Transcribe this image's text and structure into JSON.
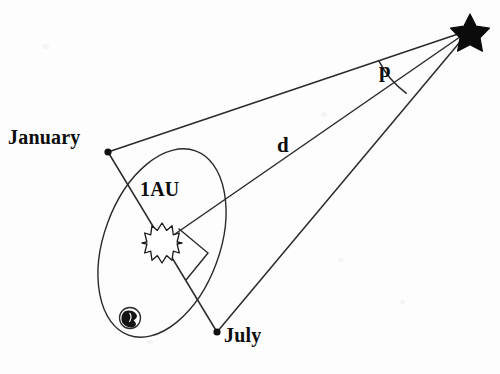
{
  "figure": {
    "background_color": "#fdfdfd",
    "ink_color": "#1a1a1a"
  },
  "labels": {
    "january": "January",
    "july": "July",
    "baseline": "1AU",
    "distance": "d",
    "parallax_angle": "p"
  },
  "icons": {
    "sun": "sun-starburst-icon",
    "earth": "earth-globe-icon",
    "star": "five-point-star-icon",
    "right_angle": "right-angle-marker-icon"
  },
  "geometry": {
    "star_point": {
      "x": 470,
      "y": 30
    },
    "sun_point": {
      "x": 162,
      "y": 243
    },
    "january_point": {
      "x": 108,
      "y": 152
    },
    "july_point": {
      "x": 217,
      "y": 332
    },
    "earth_point": {
      "x": 130,
      "y": 318
    },
    "orbit_ellipse": {
      "cx": 162,
      "cy": 243,
      "rx": 58,
      "ry": 98,
      "rotation_deg": 20
    },
    "right_angle_marker": {
      "x": 190,
      "y": 250,
      "size": 30
    },
    "parallax_arc": {
      "radius": 92,
      "from_line": "january-sightline",
      "to_line": "sun-sightline"
    }
  },
  "lines": [
    {
      "name": "january-sightline",
      "from": "january_point",
      "to": "star_point"
    },
    {
      "name": "sun-sightline",
      "from": "sun_point",
      "to": "star_point",
      "label": "d"
    },
    {
      "name": "july-sightline",
      "from": "july_point",
      "to": "star_point"
    },
    {
      "name": "baseline-1au",
      "from": "january_point",
      "to": "july_point",
      "label": "1AU"
    }
  ]
}
